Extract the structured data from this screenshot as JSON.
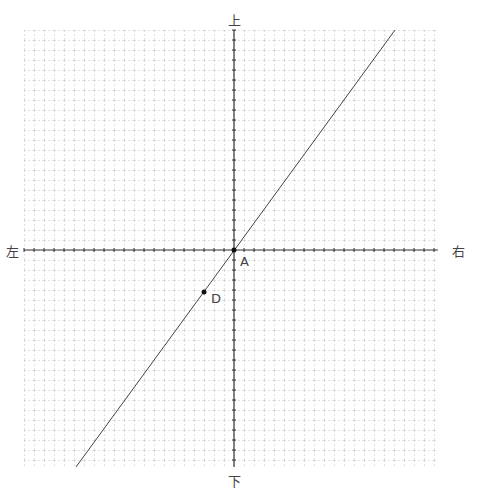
{
  "diagram": {
    "axis_labels": {
      "up": "上",
      "down": "下",
      "left": "左",
      "right": "右"
    },
    "points": [
      {
        "name": "A",
        "x": 0,
        "y": 0
      },
      {
        "name": "D",
        "x": -3,
        "y": -4.2
      }
    ],
    "grid": {
      "spacing_px": 10,
      "style": "dashed"
    },
    "line": {
      "through": [
        "A",
        "D"
      ],
      "slope": 1.4
    }
  }
}
